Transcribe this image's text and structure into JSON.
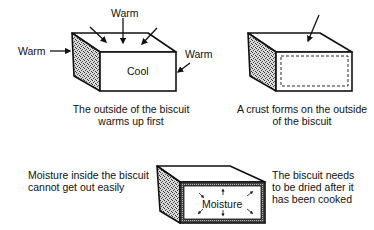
{
  "panels": [
    {
      "id": "warming",
      "box_label": "Cool",
      "arrow_labels": {
        "top": "Warm",
        "left": "Warm",
        "right": "Warm"
      },
      "caption_line1": "The outside of the biscuit",
      "caption_line2": "warms up first"
    },
    {
      "id": "crust",
      "caption_line1": "A crust forms on the outside",
      "caption_line2": "of the biscuit"
    },
    {
      "id": "moisture",
      "box_label": "Moisture",
      "left_text_line1": "Moisture inside the biscuit",
      "left_text_line2": "cannot get out easily",
      "right_text_line1": "The biscuit needs",
      "right_text_line2": "to be dried after it",
      "right_text_line3": "has been cooked"
    }
  ],
  "colors": {
    "ink": "#111111",
    "background": "#ffffff",
    "texture": "#8a8a8a"
  }
}
